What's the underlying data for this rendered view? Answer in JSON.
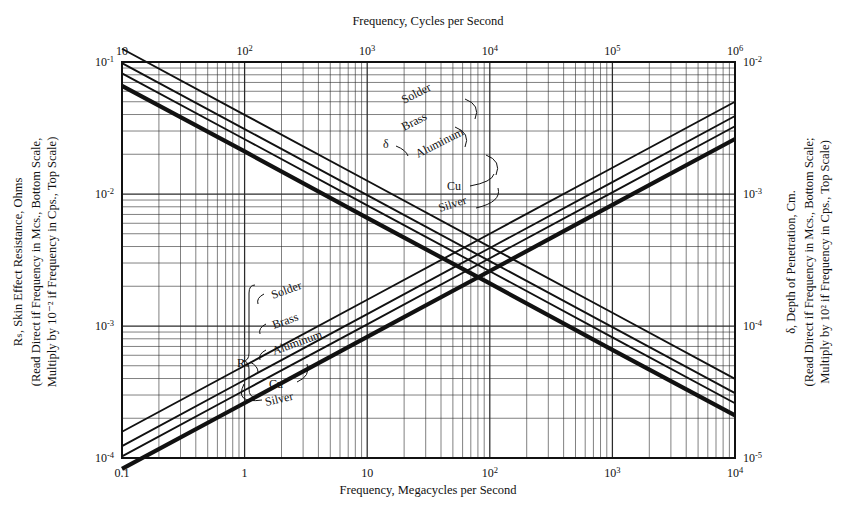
{
  "figure": {
    "background_color": "#ffffff",
    "ink_color": "#111111",
    "grid_color": "#2b2b2b"
  },
  "axes": {
    "top": {
      "title": "Frequency, Cycles per Second",
      "ticks": [
        {
          "mantissa": "10",
          "exp": ""
        },
        {
          "mantissa": "10",
          "exp": "2"
        },
        {
          "mantissa": "10",
          "exp": "3"
        },
        {
          "mantissa": "10",
          "exp": "4"
        },
        {
          "mantissa": "10",
          "exp": "5"
        },
        {
          "mantissa": "10",
          "exp": "6"
        }
      ],
      "range": [
        10,
        1000000
      ],
      "scale": "log"
    },
    "bottom": {
      "title": "Frequency, Megacycles per Second",
      "ticks": [
        {
          "mantissa": "0.1",
          "exp": ""
        },
        {
          "mantissa": "1",
          "exp": ""
        },
        {
          "mantissa": "10",
          "exp": ""
        },
        {
          "mantissa": "10",
          "exp": "2"
        },
        {
          "mantissa": "10",
          "exp": "3"
        },
        {
          "mantissa": "10",
          "exp": "4"
        }
      ],
      "range": [
        0.1,
        10000
      ],
      "scale": "log"
    },
    "left": {
      "title_line1": "Rₛ, Skin Effect Resistance, Ohms",
      "title_line2": "(Read Direct if Frequency in Mcs., Bottom Scale,",
      "title_line3": "Multiply by 10⁻² if Frequency in Cps., Top Scale)",
      "symbol": "Rs",
      "unit": "Ohms",
      "ticks": [
        {
          "mantissa": "10",
          "exp": "-1"
        },
        {
          "mantissa": "10",
          "exp": "-2"
        },
        {
          "mantissa": "10",
          "exp": "-3"
        },
        {
          "mantissa": "10",
          "exp": "-4"
        }
      ],
      "range": [
        0.0001,
        0.1
      ],
      "scale": "log"
    },
    "right": {
      "title_line1": "δ, Depth of Penetration, Cm.",
      "title_line2": "(Read Direct if Frequency in Mcs., Bottom Scale;",
      "title_line3": "Multiply by 10² if Frequency in Cps., Top Scale)",
      "symbol": "δ",
      "unit": "Cm.",
      "ticks": [
        {
          "mantissa": "10",
          "exp": "-2"
        },
        {
          "mantissa": "10",
          "exp": "-3"
        },
        {
          "mantissa": "10",
          "exp": "-4"
        },
        {
          "mantissa": "10",
          "exp": "-5"
        }
      ],
      "range": [
        1e-05,
        0.01
      ],
      "scale": "log"
    }
  },
  "annotations": {
    "delta_bracket_label": "δ",
    "rs_bracket_label": "Rₛ",
    "upper_group": [
      "Solder",
      "Brass",
      "Aluminum",
      "Cu",
      "Silver"
    ],
    "lower_group": [
      "Solder",
      "Brass",
      "Aluminum",
      "Cu",
      "Silver"
    ]
  },
  "chart_data": {
    "type": "line",
    "title": "",
    "xlabel": "Frequency, Megacycles per Second",
    "ylabel": "Rₛ, Skin Effect Resistance, Ohms",
    "y2label": "δ, Depth of Penetration, Cm.",
    "xscale": "log",
    "yscale": "log",
    "xlim": [
      0.1,
      10000
    ],
    "ylim": [
      0.0001,
      0.1
    ],
    "y2lim": [
      1e-05,
      0.01
    ],
    "grid": true,
    "grid_minor": true,
    "legend": "inline-curve-labels",
    "series": [
      {
        "name": "Solder",
        "group": "depth-of-penetration",
        "axis": "right",
        "slope": -0.5,
        "linewidth": "thin",
        "points": [
          {
            "x": 0.1,
            "y2": 0.0126
          },
          {
            "x": 1,
            "y2": 0.00398
          },
          {
            "x": 10,
            "y2": 0.00126
          },
          {
            "x": 100,
            "y2": 0.000398
          },
          {
            "x": 1000,
            "y2": 0.000126
          },
          {
            "x": 10000,
            "y2": 3.98e-05
          }
        ]
      },
      {
        "name": "Brass",
        "group": "depth-of-penetration",
        "axis": "right",
        "slope": -0.5,
        "linewidth": "thin",
        "points": [
          {
            "x": 0.1,
            "y2": 0.0098
          },
          {
            "x": 1,
            "y2": 0.0031
          },
          {
            "x": 10,
            "y2": 0.00098
          },
          {
            "x": 100,
            "y2": 0.00031
          },
          {
            "x": 1000,
            "y2": 9.8e-05
          },
          {
            "x": 10000,
            "y2": 3.1e-05
          }
        ]
      },
      {
        "name": "Aluminum",
        "group": "depth-of-penetration",
        "axis": "right",
        "slope": -0.5,
        "linewidth": "thin",
        "points": [
          {
            "x": 0.1,
            "y2": 0.0082
          },
          {
            "x": 1,
            "y2": 0.0026
          },
          {
            "x": 10,
            "y2": 0.00082
          },
          {
            "x": 100,
            "y2": 0.00026
          },
          {
            "x": 1000,
            "y2": 8.2e-05
          },
          {
            "x": 10000,
            "y2": 2.6e-05
          }
        ]
      },
      {
        "name": "Cu / Silver",
        "group": "depth-of-penetration",
        "axis": "right",
        "slope": -0.5,
        "linewidth": "thick",
        "points": [
          {
            "x": 0.1,
            "y2": 0.0066
          },
          {
            "x": 1,
            "y2": 0.0021
          },
          {
            "x": 10,
            "y2": 0.00066
          },
          {
            "x": 100,
            "y2": 0.00021
          },
          {
            "x": 1000,
            "y2": 6.6e-05
          },
          {
            "x": 10000,
            "y2": 2.1e-05
          }
        ]
      },
      {
        "name": "Solder",
        "group": "skin-effect-resistance",
        "axis": "left",
        "slope": 0.5,
        "linewidth": "thin",
        "points": [
          {
            "x": 0.1,
            "y": 0.000158
          },
          {
            "x": 1,
            "y": 0.0005
          },
          {
            "x": 10,
            "y": 0.00158
          },
          {
            "x": 100,
            "y": 0.005
          },
          {
            "x": 1000,
            "y": 0.0158
          },
          {
            "x": 10000,
            "y": 0.05
          }
        ]
      },
      {
        "name": "Brass",
        "group": "skin-effect-resistance",
        "axis": "left",
        "slope": 0.5,
        "linewidth": "thin",
        "points": [
          {
            "x": 0.1,
            "y": 0.000123
          },
          {
            "x": 1,
            "y": 0.00039
          },
          {
            "x": 10,
            "y": 0.00123
          },
          {
            "x": 100,
            "y": 0.0039
          },
          {
            "x": 1000,
            "y": 0.0123
          },
          {
            "x": 10000,
            "y": 0.039
          }
        ]
      },
      {
        "name": "Aluminum",
        "group": "skin-effect-resistance",
        "axis": "left",
        "slope": 0.5,
        "linewidth": "thin",
        "points": [
          {
            "x": 0.1,
            "y": 0.000103
          },
          {
            "x": 1,
            "y": 0.000326
          },
          {
            "x": 10,
            "y": 0.00103
          },
          {
            "x": 100,
            "y": 0.00326
          },
          {
            "x": 1000,
            "y": 0.0103
          },
          {
            "x": 10000,
            "y": 0.0326
          }
        ]
      },
      {
        "name": "Cu / Silver",
        "group": "skin-effect-resistance",
        "axis": "left",
        "slope": 0.5,
        "linewidth": "thick",
        "points": [
          {
            "x": 0.1,
            "y": 8.26e-05
          },
          {
            "x": 1,
            "y": 0.000261
          },
          {
            "x": 10,
            "y": 0.000826
          },
          {
            "x": 100,
            "y": 0.00261
          },
          {
            "x": 1000,
            "y": 0.00826
          },
          {
            "x": 10000,
            "y": 0.0261
          }
        ]
      }
    ]
  }
}
